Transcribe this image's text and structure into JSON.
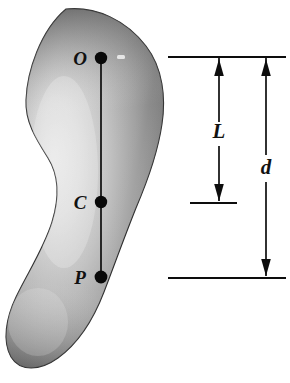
{
  "figure": {
    "type": "physics-diagram",
    "background_color": "#ffffff",
    "body": {
      "name": "rigid-body-blob",
      "fill_light": "#e8e8e8",
      "fill_mid": "#a8a8a8",
      "fill_dark": "#4a4a4a",
      "outline_color": "#2b2b2b"
    },
    "axis": {
      "name": "vertical-axis-line",
      "color": "#0d0d0d",
      "from_point": "O",
      "to_point": "P"
    },
    "points": [
      {
        "id": "O",
        "label": "O",
        "x": 101,
        "y": 58,
        "label_x": 80,
        "label_y": 65,
        "role": "pivot-point"
      },
      {
        "id": "C",
        "label": "C",
        "x": 101,
        "y": 202,
        "label_x": 80,
        "label_y": 209,
        "role": "center-of-mass"
      },
      {
        "id": "P",
        "label": "P",
        "x": 101,
        "y": 277,
        "label_x": 80,
        "label_y": 284,
        "role": "center-of-oscillation"
      }
    ],
    "dimensions": [
      {
        "id": "L",
        "label": "L",
        "label_x": 219,
        "label_y": 137,
        "arrow_x": 219,
        "top_y": 57,
        "bottom_y": 203,
        "description": "distance from O to C"
      },
      {
        "id": "d",
        "label": "d",
        "label_x": 266,
        "label_y": 172,
        "arrow_x": 266,
        "top_y": 57,
        "bottom_y": 278,
        "description": "distance from O to P"
      }
    ],
    "reference_lines": [
      {
        "id": "top-extension-line",
        "x1": 168,
        "x2": 286,
        "y": 57
      },
      {
        "id": "middle-extension-line",
        "x1": 190,
        "x2": 237,
        "y": 203
      },
      {
        "id": "bottom-extension-line",
        "x1": 168,
        "x2": 286,
        "y": 278
      }
    ]
  }
}
